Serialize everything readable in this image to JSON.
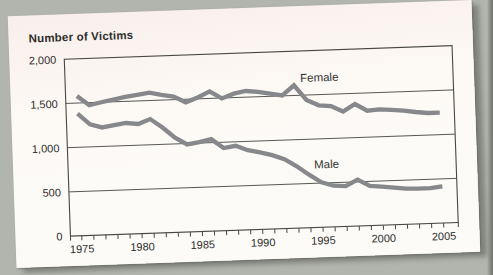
{
  "chart_data": {
    "type": "line",
    "title": "Number of Victims",
    "x": [
      1975,
      1976,
      1977,
      1978,
      1979,
      1980,
      1981,
      1982,
      1983,
      1984,
      1985,
      1986,
      1987,
      1988,
      1989,
      1990,
      1991,
      1992,
      1993,
      1994,
      1995,
      1996,
      1997,
      1998,
      1999,
      2000,
      2001,
      2002,
      2003,
      2004,
      2005
    ],
    "series": [
      {
        "name": "Female",
        "values": [
          1580,
          1470,
          1500,
          1525,
          1550,
          1570,
          1590,
          1560,
          1535,
          1465,
          1515,
          1580,
          1495,
          1545,
          1570,
          1555,
          1530,
          1505,
          1615,
          1445,
          1380,
          1365,
          1300,
          1380,
          1300,
          1310,
          1300,
          1285,
          1265,
          1250,
          1250
        ]
      },
      {
        "name": "Male",
        "values": [
          1380,
          1255,
          1215,
          1235,
          1255,
          1240,
          1290,
          1190,
          1070,
          990,
          1010,
          1040,
          935,
          955,
          900,
          870,
          835,
          785,
          700,
          600,
          510,
          465,
          455,
          525,
          450,
          435,
          420,
          405,
          400,
          400,
          415
        ]
      }
    ],
    "x_tick_years": [
      1975,
      1980,
      1985,
      1990,
      1995,
      2000,
      2005
    ],
    "x_tick_labels": [
      "1975",
      "1980",
      "1985",
      "1990",
      "1995",
      "2000",
      "2005"
    ],
    "yticks": [
      0,
      500,
      1000,
      1500,
      2000
    ],
    "ytick_labels": [
      "0",
      "500",
      "1,000",
      "1,500",
      "2,000"
    ],
    "ylim": [
      0,
      2000
    ],
    "xlim_years": [
      1975,
      2005
    ],
    "grid": true,
    "legend_position": "inline-labels",
    "line_color": "#87888b",
    "axis_color": "#474745",
    "text_color": "#2e2d2b"
  }
}
